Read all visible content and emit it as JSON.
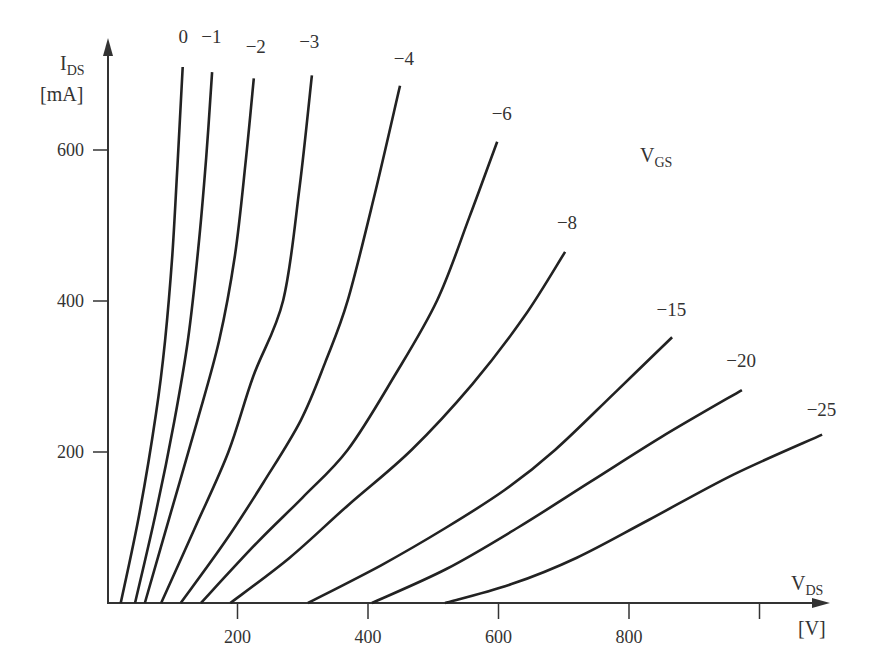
{
  "chart_data": {
    "type": "line",
    "title": "",
    "xlabel": "V_DS [V]",
    "ylabel": "I_DS [mA]",
    "x_axis": {
      "label_main": "V",
      "label_sub": "DS",
      "unit": "[V]",
      "range": [
        0,
        1090
      ],
      "ticks": [
        200,
        400,
        600,
        800,
        1000
      ],
      "tick_labels": [
        "200",
        "400",
        "600",
        "800",
        ""
      ]
    },
    "y_axis": {
      "label_main": "I",
      "label_sub": "DS",
      "unit": "[mA]",
      "range": [
        0,
        720
      ],
      "ticks": [
        200,
        400,
        600
      ],
      "tick_labels": [
        "200",
        "400",
        "600"
      ]
    },
    "legend_title": {
      "main": "V",
      "sub": "GS"
    },
    "grid": false,
    "series": [
      {
        "name": "0",
        "points": [
          [
            21,
            0
          ],
          [
            50,
            120
          ],
          [
            75,
            250
          ],
          [
            89,
            348
          ],
          [
            100,
            460
          ],
          [
            108,
            580
          ],
          [
            116,
            710
          ]
        ]
      },
      {
        "name": "-1",
        "points": [
          [
            43,
            0
          ],
          [
            75,
            120
          ],
          [
            103,
            240
          ],
          [
            124,
            348
          ],
          [
            140,
            470
          ],
          [
            152,
            590
          ],
          [
            161,
            703
          ]
        ]
      },
      {
        "name": "-2",
        "points": [
          [
            58,
            0
          ],
          [
            98,
            120
          ],
          [
            138,
            240
          ],
          [
            172,
            348
          ],
          [
            196,
            460
          ],
          [
            212,
            580
          ],
          [
            225,
            695
          ]
        ]
      },
      {
        "name": "-3",
        "points": [
          [
            83,
            0
          ],
          [
            135,
            100
          ],
          [
            186,
            200
          ],
          [
            224,
            300
          ],
          [
            270,
            401
          ],
          [
            295,
            550
          ],
          [
            314,
            699
          ]
        ]
      },
      {
        "name": "-4",
        "points": [
          [
            113,
            0
          ],
          [
            180,
            80
          ],
          [
            240,
            160
          ],
          [
            297,
            242
          ],
          [
            335,
            320
          ],
          [
            369,
            401
          ],
          [
            410,
            540
          ],
          [
            449,
            685
          ]
        ]
      },
      {
        "name": "-6",
        "points": [
          [
            144,
            0
          ],
          [
            230,
            80
          ],
          [
            300,
            140
          ],
          [
            369,
            203
          ],
          [
            440,
            300
          ],
          [
            506,
            401
          ],
          [
            555,
            510
          ],
          [
            598,
            611
          ]
        ]
      },
      {
        "name": "-8",
        "points": [
          [
            189,
            0
          ],
          [
            280,
            60
          ],
          [
            370,
            130
          ],
          [
            467,
            203
          ],
          [
            560,
            290
          ],
          [
            640,
            380
          ],
          [
            702,
            465
          ]
        ]
      },
      {
        "name": "-15",
        "points": [
          [
            308,
            0
          ],
          [
            420,
            50
          ],
          [
            520,
            100
          ],
          [
            610,
            150
          ],
          [
            687,
            203
          ],
          [
            780,
            280
          ],
          [
            866,
            352
          ]
        ]
      },
      {
        "name": "-20",
        "points": [
          [
            406,
            0
          ],
          [
            520,
            45
          ],
          [
            630,
            100
          ],
          [
            740,
            160
          ],
          [
            850,
            220
          ],
          [
            973,
            282
          ]
        ]
      },
      {
        "name": "-25",
        "points": [
          [
            518,
            0
          ],
          [
            620,
            25
          ],
          [
            720,
            60
          ],
          [
            830,
            110
          ],
          [
            960,
            170
          ],
          [
            1096,
            223
          ]
        ]
      }
    ],
    "curve_labels": [
      {
        "name": "0",
        "text": "0",
        "at": [
          117,
          742
        ]
      },
      {
        "name": "-1",
        "text": "−1",
        "at": [
          160,
          742
        ]
      },
      {
        "name": "-2",
        "text": "−2",
        "at": [
          228,
          728
        ]
      },
      {
        "name": "-3",
        "text": "−3",
        "at": [
          310,
          735
        ]
      },
      {
        "name": "-4",
        "text": "−4",
        "at": [
          455,
          713
        ]
      },
      {
        "name": "-6",
        "text": "−6",
        "at": [
          605,
          640
        ]
      },
      {
        "name": "-8",
        "text": "−8",
        "at": [
          705,
          495
        ]
      },
      {
        "name": "-15",
        "text": "−15",
        "at": [
          865,
          380
        ]
      },
      {
        "name": "-20",
        "text": "−20",
        "at": [
          972,
          312
        ]
      },
      {
        "name": "-25",
        "text": "−25",
        "at": [
          1095,
          248
        ]
      }
    ]
  }
}
